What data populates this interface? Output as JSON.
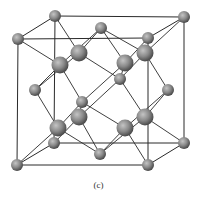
{
  "caption": "(c)",
  "colors": {
    "background": "#ffffff",
    "bond": "#2a2a2a",
    "atom_light": "#b8b8b8",
    "atom_mid": "#8a8a8a",
    "atom_dark": "#4a4a4a"
  },
  "structure": {
    "type": "diamond-cubic-unit-cell",
    "cube_edges": [
      [
        "bl_back_t",
        "br_back_t"
      ],
      [
        "bl_front_t",
        "br_front_t"
      ],
      [
        "bl_back_t",
        "bl_front_t"
      ],
      [
        "br_back_t",
        "br_front_t"
      ],
      [
        "bl_back_b",
        "br_back_b"
      ],
      [
        "bl_front_b",
        "br_front_b"
      ],
      [
        "bl_back_b",
        "bl_front_b"
      ],
      [
        "br_back_b",
        "br_front_b"
      ],
      [
        "bl_back_t",
        "bl_back_b"
      ],
      [
        "br_back_t",
        "br_back_b"
      ],
      [
        "bl_front_t",
        "bl_front_b"
      ],
      [
        "br_front_t",
        "br_front_b"
      ]
    ],
    "atoms": {
      "bl_back_t": {
        "x": 55,
        "y": 16,
        "r": 6,
        "kind": "corner"
      },
      "br_back_t": {
        "x": 184,
        "y": 17,
        "r": 6,
        "kind": "corner"
      },
      "bl_front_t": {
        "x": 18,
        "y": 39,
        "r": 6,
        "kind": "corner"
      },
      "br_front_t": {
        "x": 148,
        "y": 38,
        "r": 6,
        "kind": "corner"
      },
      "bl_back_b": {
        "x": 54,
        "y": 143,
        "r": 6,
        "kind": "corner"
      },
      "br_back_b": {
        "x": 184,
        "y": 143,
        "r": 6,
        "kind": "corner"
      },
      "bl_front_b": {
        "x": 17,
        "y": 165,
        "r": 6,
        "kind": "corner"
      },
      "br_front_b": {
        "x": 148,
        "y": 165,
        "r": 6,
        "kind": "corner"
      },
      "f_top": {
        "x": 101,
        "y": 28,
        "r": 6,
        "kind": "face"
      },
      "f_left": {
        "x": 35,
        "y": 90,
        "r": 6,
        "kind": "face"
      },
      "f_right": {
        "x": 168,
        "y": 90,
        "r": 6,
        "kind": "face"
      },
      "f_front": {
        "x": 82,
        "y": 102,
        "r": 6,
        "kind": "face"
      },
      "f_back": {
        "x": 120,
        "y": 79,
        "r": 6,
        "kind": "face"
      },
      "f_bottom": {
        "x": 100,
        "y": 154,
        "r": 6,
        "kind": "face"
      },
      "i1": {
        "x": 60,
        "y": 65,
        "r": 8.5,
        "kind": "interior"
      },
      "i2": {
        "x": 79,
        "y": 53,
        "r": 8.5,
        "kind": "interior"
      },
      "i3": {
        "x": 125,
        "y": 63,
        "r": 8.5,
        "kind": "interior"
      },
      "i4": {
        "x": 145,
        "y": 53,
        "r": 8.5,
        "kind": "interior"
      },
      "i5": {
        "x": 79,
        "y": 117,
        "r": 8.5,
        "kind": "interior"
      },
      "i6": {
        "x": 58,
        "y": 128,
        "r": 8.5,
        "kind": "interior"
      },
      "i7": {
        "x": 125,
        "y": 128,
        "r": 8.5,
        "kind": "interior"
      },
      "i8": {
        "x": 145,
        "y": 117,
        "r": 8.5,
        "kind": "interior"
      }
    },
    "bonds": [
      [
        "i2",
        "bl_back_t"
      ],
      [
        "i2",
        "f_top"
      ],
      [
        "i2",
        "f_back"
      ],
      [
        "i2",
        "f_left"
      ],
      [
        "i1",
        "bl_front_t"
      ],
      [
        "i1",
        "f_top"
      ],
      [
        "i1",
        "f_left"
      ],
      [
        "i1",
        "f_front"
      ],
      [
        "i4",
        "br_back_t"
      ],
      [
        "i4",
        "f_top"
      ],
      [
        "i4",
        "f_right"
      ],
      [
        "i4",
        "f_back"
      ],
      [
        "i3",
        "br_front_t"
      ],
      [
        "i3",
        "f_top"
      ],
      [
        "i3",
        "f_front"
      ],
      [
        "i3",
        "f_back"
      ],
      [
        "i5",
        "f_front"
      ],
      [
        "i5",
        "f_back"
      ],
      [
        "i5",
        "bl_back_b"
      ],
      [
        "i5",
        "f_bottom"
      ],
      [
        "i6",
        "f_left"
      ],
      [
        "i6",
        "f_front"
      ],
      [
        "i6",
        "bl_front_b"
      ],
      [
        "i6",
        "f_bottom"
      ],
      [
        "i8",
        "f_right"
      ],
      [
        "i8",
        "f_back"
      ],
      [
        "i8",
        "br_back_b"
      ],
      [
        "i8",
        "f_bottom"
      ],
      [
        "i7",
        "f_front"
      ],
      [
        "i7",
        "f_right"
      ],
      [
        "i7",
        "br_front_b"
      ],
      [
        "i7",
        "f_bottom"
      ]
    ]
  }
}
